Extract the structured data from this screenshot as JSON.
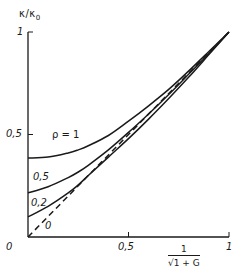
{
  "chart_data": {
    "type": "line",
    "title": "",
    "xlabel": "1/√(1 + G)",
    "xlabel_numerator": "1",
    "xlabel_denominator": "√1 + G",
    "ylabel": "κ/κ",
    "ylabel_sub": "0",
    "xlim": [
      0,
      1
    ],
    "ylim": [
      0,
      1
    ],
    "grid": false,
    "legend": "inline curve labels",
    "x_ticks": [
      "0",
      "0,5",
      "1"
    ],
    "y_ticks": [
      "0,5",
      "1"
    ],
    "origin_label": "0",
    "series": [
      {
        "name": "ρ = 1",
        "label": "ρ = 1",
        "style": "solid",
        "x": [
          0,
          0.1,
          0.2,
          0.25,
          0.3,
          0.4,
          0.5,
          0.6,
          0.7,
          0.8,
          0.9,
          1.0
        ],
        "y": [
          0.385,
          0.39,
          0.41,
          0.425,
          0.445,
          0.495,
          0.565,
          0.64,
          0.72,
          0.81,
          0.905,
          1.0
        ]
      },
      {
        "name": "ρ = 0.5",
        "label": "0,5",
        "style": "solid",
        "x": [
          0,
          0.1,
          0.2,
          0.25,
          0.3,
          0.4,
          0.5,
          0.6,
          0.7,
          0.8,
          0.9,
          1.0
        ],
        "y": [
          0.215,
          0.245,
          0.29,
          0.317,
          0.35,
          0.425,
          0.51,
          0.6,
          0.695,
          0.795,
          0.895,
          1.0
        ]
      },
      {
        "name": "ρ = 0.2",
        "label": "0,2",
        "style": "solid",
        "x": [
          0,
          0.1,
          0.2,
          0.25,
          0.3,
          0.4,
          0.5,
          0.6,
          0.7,
          0.8,
          0.9,
          1.0
        ],
        "y": [
          0.098,
          0.15,
          0.215,
          0.254,
          0.3,
          0.39,
          0.48,
          0.575,
          0.675,
          0.78,
          0.89,
          1.0
        ]
      },
      {
        "name": "ρ = 0",
        "label": "0",
        "style": "dashed",
        "x": [
          0,
          1.0
        ],
        "y": [
          0,
          1.0
        ]
      }
    ]
  },
  "labels": {
    "y_tick_1": "1",
    "y_tick_05": "0,5",
    "x_tick_05": "0,5",
    "x_tick_1": "1",
    "origin": "0",
    "rho1": "ρ = 1",
    "rho05": "0,5",
    "rho02": "0,2",
    "rho0": "0"
  }
}
